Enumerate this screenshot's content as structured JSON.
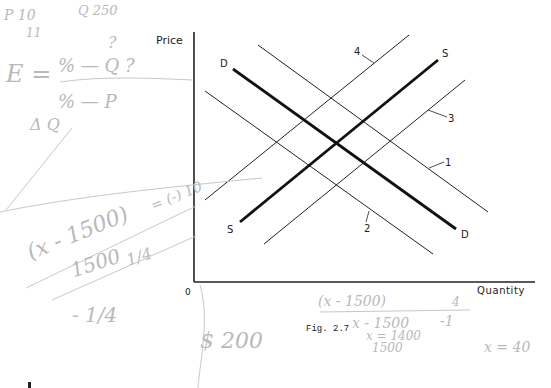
{
  "figure": {
    "caption": "Fig. 2.7",
    "axes": {
      "y_label": "Price",
      "x_label": "Quantity",
      "origin_label": "0"
    },
    "curves": {
      "demand_label_top": "D",
      "demand_label_bottom": "D",
      "supply_label_top": "S",
      "supply_label_bottom": "S",
      "shift_labels": [
        "1",
        "2",
        "3",
        "4"
      ]
    }
  },
  "handwritten_notes": {
    "top_left_1": "P 10",
    "top_left_2": "11",
    "top_q": "Q 250",
    "question": "?",
    "elasticity_lhs": "E =",
    "elasticity_num": "%   — Q ?",
    "elasticity_den": "%   — P",
    "delta_q": "Δ Q",
    "eq1": "(x - 1500)",
    "eq1_result": "= (-) 10",
    "eq2_num": "1500",
    "eq2_frac": "1/4",
    "eq3": "- 1/4",
    "price": "$ 200",
    "eq4": "(x - 1500)",
    "eq4_den": "4",
    "eq5_num": "x - 1500",
    "eq5_rhs": "-1",
    "eq6": "x = 1400",
    "eq6_den": "1500",
    "eq7": "x = 40"
  }
}
